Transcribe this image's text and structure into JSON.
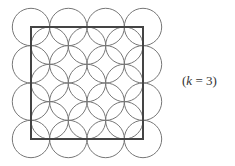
{
  "figure": {
    "label_open": "(",
    "label_var": "k",
    "label_rest": " = 3)",
    "square": {
      "x": 31,
      "y": 27,
      "size": 112,
      "stroke": "#444444",
      "stroke_width": 2
    },
    "circles": {
      "radius": 18.7,
      "stroke": "#777777",
      "stroke_width": 1,
      "outer_grid": {
        "count": 4,
        "origin_x": 31,
        "origin_y": 27,
        "spacing": 37.33
      },
      "inner_grid": {
        "count": 3,
        "origin_x": 49.67,
        "origin_y": 45.67,
        "spacing": 37.33
      }
    }
  }
}
